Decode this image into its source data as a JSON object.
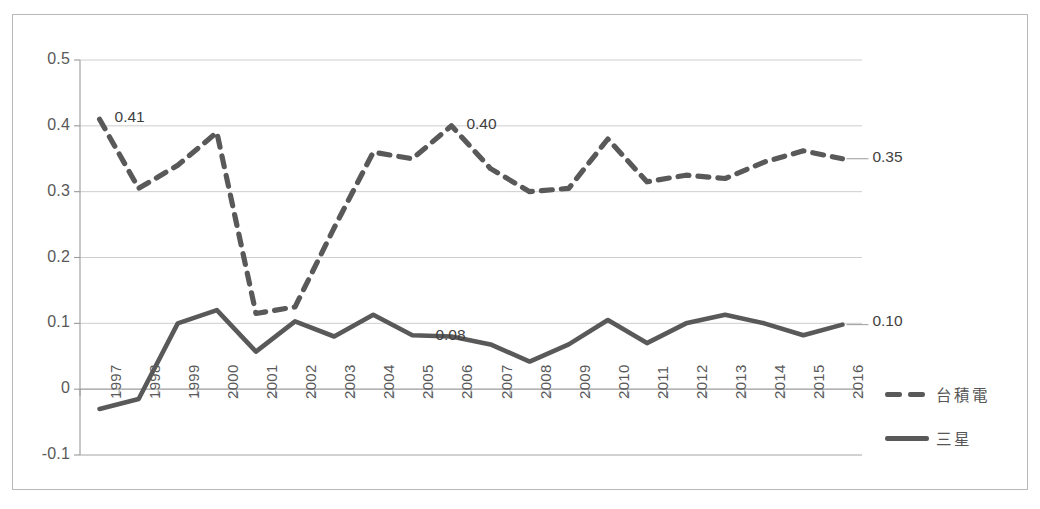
{
  "chart_data": {
    "type": "line",
    "title": "",
    "xlabel": "",
    "ylabel": "",
    "categories": [
      "1997",
      "1998",
      "1999",
      "2000",
      "2001",
      "2002",
      "2003",
      "2004",
      "2005",
      "2006",
      "2007",
      "2008",
      "2009",
      "2010",
      "2011",
      "2012",
      "2013",
      "2014",
      "2015",
      "2016"
    ],
    "ylim": [
      -0.1,
      0.5
    ],
    "yticks": [
      "0.5",
      "0.4",
      "0.3",
      "0.2",
      "0.1",
      "0",
      "-0.1"
    ],
    "ytick_values": [
      0.5,
      0.4,
      0.3,
      0.2,
      0.1,
      0,
      -0.1
    ],
    "grid": true,
    "legend_position": "right",
    "series": [
      {
        "name": "台積電",
        "style": "dashed",
        "color": "#595959",
        "values": [
          0.41,
          0.305,
          0.34,
          0.39,
          0.115,
          0.125,
          0.245,
          0.36,
          0.35,
          0.4,
          0.335,
          0.3,
          0.305,
          0.38,
          0.315,
          0.325,
          0.32,
          0.345,
          0.362,
          0.35
        ]
      },
      {
        "name": "三星",
        "style": "solid",
        "color": "#595959",
        "values": [
          -0.03,
          -0.015,
          0.1,
          0.12,
          0.057,
          0.103,
          0.08,
          0.113,
          0.082,
          0.08,
          0.068,
          0.042,
          0.068,
          0.105,
          0.07,
          0.1,
          0.113,
          0.1,
          0.082,
          0.098
        ]
      }
    ],
    "annotations": [
      {
        "text": "0.41",
        "series": "台積電",
        "category": "1997",
        "value": 0.41,
        "placement": "right-of-point"
      },
      {
        "text": "0.40",
        "series": "台積電",
        "category": "2006",
        "value": 0.4,
        "placement": "right-of-point"
      },
      {
        "text": "0.35",
        "series": "台積電",
        "category": "2016",
        "value": 0.35,
        "placement": "end-of-line"
      },
      {
        "text": "0.08",
        "series": "三星",
        "category": "2006",
        "value": 0.08,
        "placement": "on-line"
      },
      {
        "text": "0.10",
        "series": "三星",
        "category": "2016",
        "value": 0.1,
        "placement": "end-of-line"
      }
    ]
  },
  "legend": {
    "items": [
      {
        "label": "台積電",
        "style": "dashed"
      },
      {
        "label": "三星",
        "style": "solid"
      }
    ]
  },
  "colors": {
    "line": "#595959",
    "grid": "#c8c8c8",
    "axis": "#9a9a9a",
    "frame": "#b9b9b9",
    "text": "#595959",
    "label_text": "#3f3f3f"
  }
}
